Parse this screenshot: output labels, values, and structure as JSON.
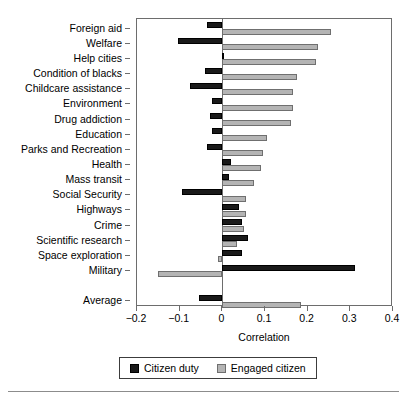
{
  "chart_data": {
    "type": "bar",
    "orientation": "horizontal",
    "title": "",
    "xlabel": "Correlation",
    "ylabel": "",
    "xlim": [
      -0.2,
      0.4
    ],
    "xticks": [
      -0.2,
      -0.1,
      0,
      0.1,
      0.2,
      0.3,
      0.4
    ],
    "xtick_labels": [
      "−0.2",
      "−0.1",
      "0",
      "0.1",
      "0.2",
      "0.3",
      "0.4"
    ],
    "grid": false,
    "legend_position": "bottom",
    "categories": [
      "Foreign aid",
      "Welfare",
      "Help cities",
      "Condition of blacks",
      "Childcare assistance",
      "Environment",
      "Drug addiction",
      "Education",
      "Parks and Recreation",
      "Health",
      "Mass transit",
      "Social Security",
      "Highways",
      "Crime",
      "Scientific research",
      "Space exploration",
      "Military",
      "Average"
    ],
    "series": [
      {
        "name": "Citizen duty",
        "color": "#1a1a1a",
        "values": [
          -0.035,
          -0.105,
          0.005,
          -0.04,
          -0.075,
          -0.025,
          -0.03,
          -0.025,
          -0.035,
          0.02,
          0.015,
          -0.095,
          0.04,
          0.045,
          0.06,
          0.045,
          0.31,
          -0.055
        ]
      },
      {
        "name": "Engaged citizen",
        "color": "#b4b4b4",
        "values": [
          0.255,
          0.225,
          0.22,
          0.175,
          0.165,
          0.165,
          0.16,
          0.105,
          0.095,
          0.09,
          0.075,
          0.055,
          0.055,
          0.05,
          0.035,
          -0.01,
          -0.15,
          0.185
        ]
      }
    ]
  },
  "legend": {
    "entries": [
      {
        "label": "Citizen duty",
        "swatch": "duty"
      },
      {
        "label": "Engaged citizen",
        "swatch": "engaged"
      }
    ]
  }
}
